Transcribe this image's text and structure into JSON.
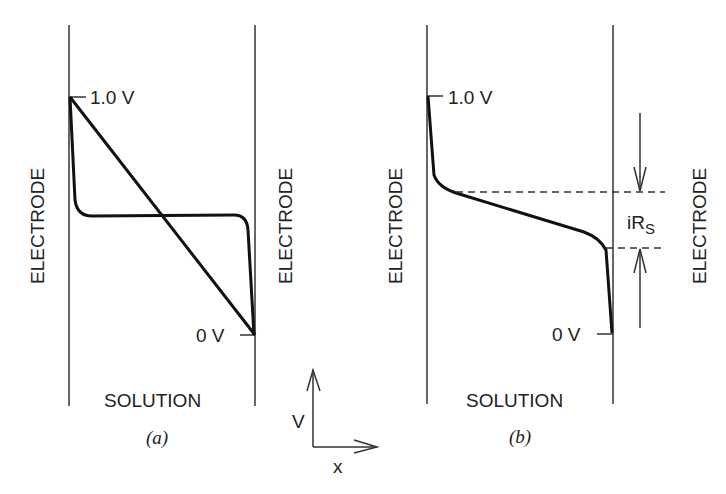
{
  "panels": [
    {
      "id": "a",
      "caption": "(a)",
      "top_label": "1.0 V",
      "bottom_label": "0 V",
      "left_electrode": "ELECTRODE",
      "right_electrode": "ELECTRODE",
      "solution_label": "SOLUTION",
      "curves": [
        "linear potential drop (no electrolyte)",
        "flat plateau with sharp drops at electrodes"
      ]
    },
    {
      "id": "b",
      "caption": "(b)",
      "top_label": "1.0 V",
      "bottom_label": "0 V",
      "left_electrode": "ELECTRODE",
      "right_electrode": "ELECTRODE",
      "solution_label": "SOLUTION",
      "annotation": "iR",
      "annotation_sub": "S"
    }
  ],
  "axes": {
    "y_label": "V",
    "x_label": "x"
  }
}
